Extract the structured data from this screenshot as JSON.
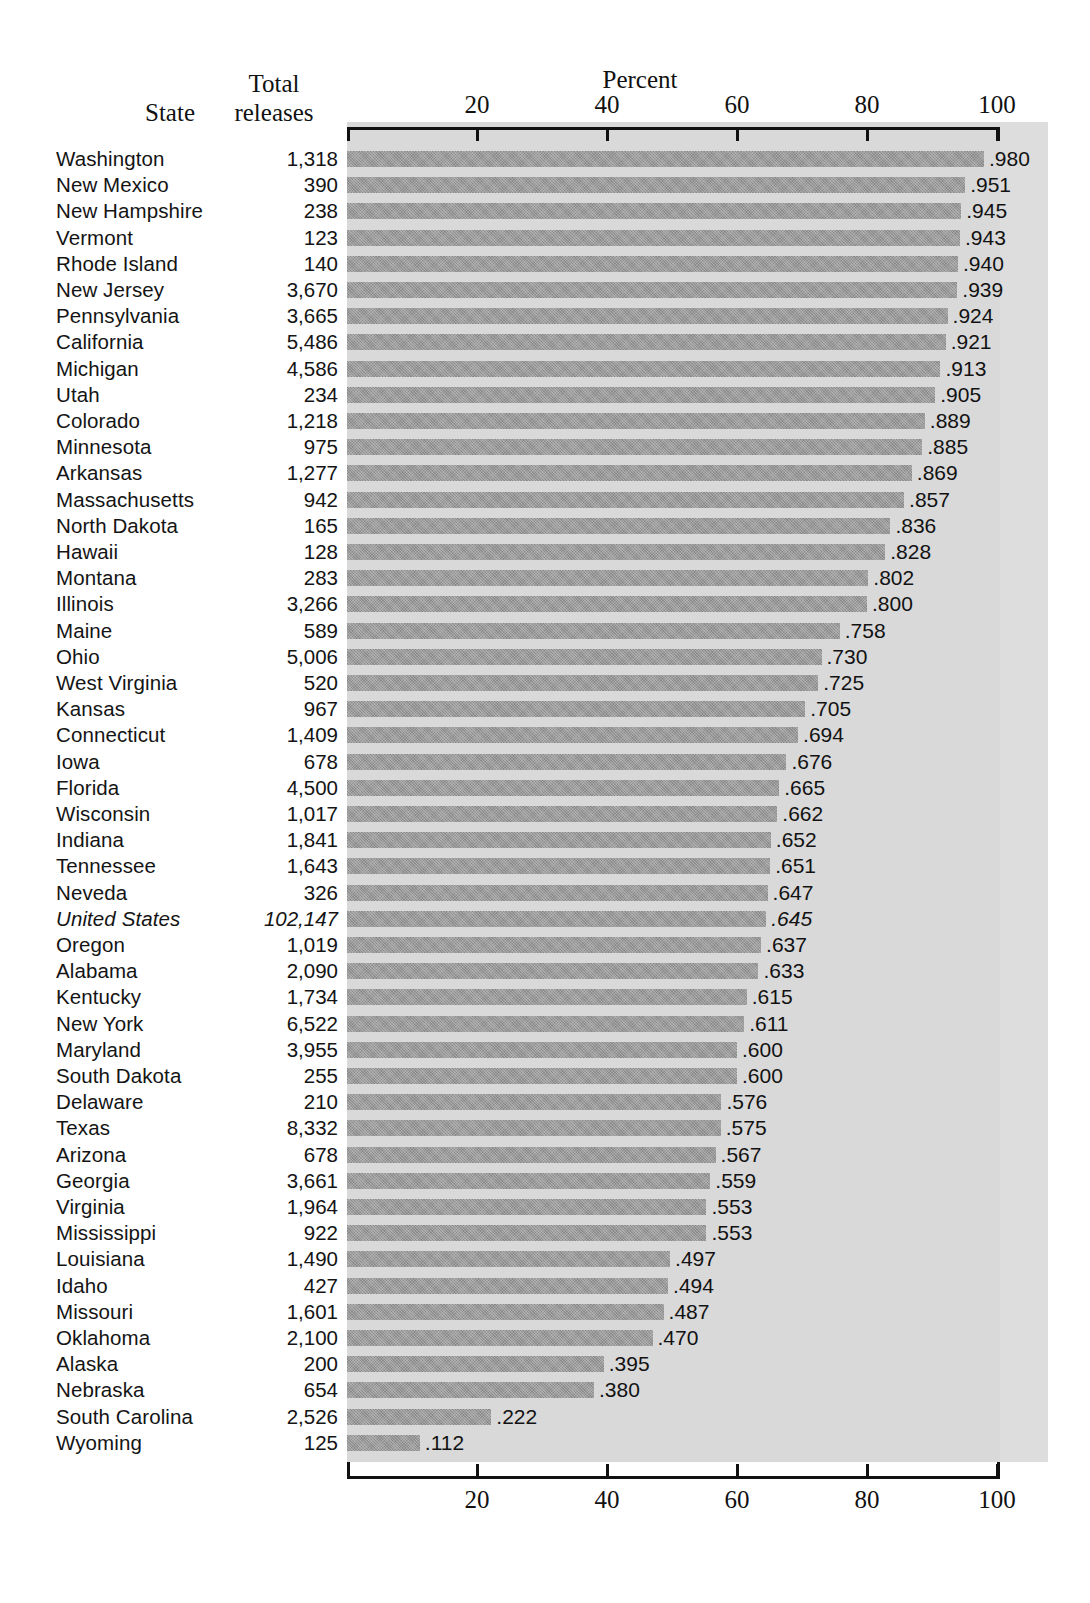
{
  "headers": {
    "state": "State",
    "total_line1": "Total",
    "total_line2": "releases",
    "percent": "Percent"
  },
  "axis": {
    "ticks": [
      "20",
      "40",
      "60",
      "80",
      "100"
    ],
    "tick_values": [
      20,
      40,
      60,
      80,
      100
    ],
    "min": 0,
    "max": 100
  },
  "colors": {
    "bar_fill": "#9a9a9a",
    "panel_background": "#d9d9d9",
    "axis_line": "#111111",
    "text": "#141414",
    "page_background": "#ffffff"
  },
  "chart_data": {
    "type": "bar",
    "orientation": "horizontal",
    "title": "Percent",
    "xlabel": "Percent",
    "ylabel": "State",
    "xlim": [
      0,
      100
    ],
    "xticks": [
      20,
      40,
      60,
      80,
      100
    ],
    "grid": false,
    "legend": null,
    "value_format": "leading-decimal proportion (e.g. .980 = 98.0 percent)",
    "columns": [
      "State",
      "Total releases",
      "Percent"
    ],
    "categories": [
      "Washington",
      "New Mexico",
      "New Hampshire",
      "Vermont",
      "Rhode Island",
      "New Jersey",
      "Pennsylvania",
      "California",
      "Michigan",
      "Utah",
      "Colorado",
      "Minnesota",
      "Arkansas",
      "Massachusetts",
      "North Dakota",
      "Hawaii",
      "Montana",
      "Illinois",
      "Maine",
      "Ohio",
      "West Virginia",
      "Kansas",
      "Connecticut",
      "Iowa",
      "Florida",
      "Wisconsin",
      "Indiana",
      "Tennessee",
      "Neveda",
      "United States",
      "Oregon",
      "Alabama",
      "Kentucky",
      "New York",
      "Maryland",
      "South Dakota",
      "Delaware",
      "Texas",
      "Arizona",
      "Georgia",
      "Virginia",
      "Mississippi",
      "Louisiana",
      "Idaho",
      "Missouri",
      "Oklahoma",
      "Alaska",
      "Nebraska",
      "South Carolina",
      "Wyoming"
    ],
    "values": [
      98.0,
      95.1,
      94.5,
      94.3,
      94.0,
      93.9,
      92.4,
      92.1,
      91.3,
      90.5,
      88.9,
      88.5,
      86.9,
      85.7,
      83.6,
      82.8,
      80.2,
      80.0,
      75.8,
      73.0,
      72.5,
      70.5,
      69.4,
      67.6,
      66.5,
      66.2,
      65.2,
      65.1,
      64.7,
      64.5,
      63.7,
      63.3,
      61.5,
      61.1,
      60.0,
      60.0,
      57.6,
      57.5,
      56.7,
      55.9,
      55.3,
      55.3,
      49.7,
      49.4,
      48.7,
      47.0,
      39.5,
      38.0,
      22.2,
      11.2
    ],
    "value_labels": [
      ".980",
      ".951",
      ".945",
      ".943",
      ".940",
      ".939",
      ".924",
      ".921",
      ".913",
      ".905",
      ".889",
      ".885",
      ".869",
      ".857",
      ".836",
      ".828",
      ".802",
      ".800",
      ".758",
      ".730",
      ".725",
      ".705",
      ".694",
      ".676",
      ".665",
      ".662",
      ".652",
      ".651",
      ".647",
      ".645",
      ".637",
      ".633",
      ".615",
      ".611",
      ".600",
      ".600",
      ".576",
      ".575",
      ".567",
      ".559",
      ".553",
      ".553",
      ".497",
      ".494",
      ".487",
      ".470",
      ".395",
      ".380",
      ".222",
      ".112"
    ],
    "total_releases": [
      "1,318",
      "390",
      "238",
      "123",
      "140",
      "3,670",
      "3,665",
      "5,486",
      "4,586",
      "234",
      "1,218",
      "975",
      "1,277",
      "942",
      "165",
      "128",
      "283",
      "3,266",
      "589",
      "5,006",
      "520",
      "967",
      "1,409",
      "678",
      "4,500",
      "1,017",
      "1,841",
      "1,643",
      "326",
      "102,147",
      "1,019",
      "2,090",
      "1,734",
      "6,522",
      "3,955",
      "255",
      "210",
      "8,332",
      "678",
      "3,661",
      "1,964",
      "922",
      "1,490",
      "427",
      "1,601",
      "2,100",
      "200",
      "654",
      "2,526",
      "125"
    ],
    "emphasized_row": "United States"
  }
}
